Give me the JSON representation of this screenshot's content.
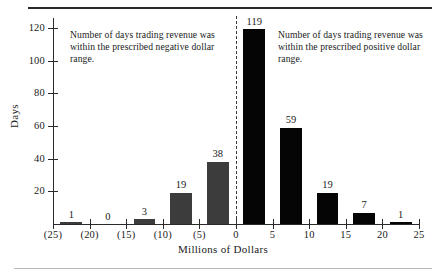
{
  "chart_data": {
    "type": "bar",
    "title": "",
    "xlabel": "Millions of Dollars",
    "ylabel": "Days",
    "xlim": [
      -25,
      25
    ],
    "ylim": [
      0,
      126
    ],
    "grid": false,
    "legend": "none",
    "x_tick_labels": [
      "(25)",
      "(20)",
      "(15)",
      "(10)",
      "(5)",
      "0",
      "5",
      "10",
      "15",
      "20",
      "25"
    ],
    "x_tick_values": [
      -25,
      -20,
      -15,
      -10,
      -5,
      0,
      5,
      10,
      15,
      20,
      25
    ],
    "y_tick_labels": [
      "20",
      "40",
      "60",
      "80",
      "100",
      "120"
    ],
    "y_tick_values": [
      20,
      40,
      60,
      80,
      100,
      120
    ],
    "bin_width": 5,
    "bars": [
      {
        "label": "1",
        "value": 1,
        "bin_start": -24,
        "bin_end": -21,
        "sign": "neg"
      },
      {
        "label": "0",
        "value": 0,
        "bin_start": -19,
        "bin_end": -16,
        "sign": "neg"
      },
      {
        "label": "3",
        "value": 3,
        "bin_start": -14,
        "bin_end": -11,
        "sign": "neg"
      },
      {
        "label": "19",
        "value": 19,
        "bin_start": -9,
        "bin_end": -6,
        "sign": "neg"
      },
      {
        "label": "38",
        "value": 38,
        "bin_start": -4,
        "bin_end": -1,
        "sign": "neg"
      },
      {
        "label": "119",
        "value": 119,
        "bin_start": 1,
        "bin_end": 4,
        "sign": "pos"
      },
      {
        "label": "59",
        "value": 59,
        "bin_start": 6,
        "bin_end": 9,
        "sign": "pos"
      },
      {
        "label": "19",
        "value": 19,
        "bin_start": 11,
        "bin_end": 14,
        "sign": "pos"
      },
      {
        "label": "7",
        "value": 7,
        "bin_start": 16,
        "bin_end": 19,
        "sign": "pos"
      },
      {
        "label": "1",
        "value": 1,
        "bin_start": 21,
        "bin_end": 24,
        "sign": "pos"
      }
    ],
    "annotations": [
      {
        "id": "negative",
        "text": "Number of days trading revenue was within the prescribed negative dollar range."
      },
      {
        "id": "positive",
        "text": "Number of days trading revenue was within the prescribed positive dollar range."
      }
    ],
    "zero_divider": {
      "x": 0,
      "style": "dashed"
    },
    "colors": {
      "negative_bar": "#3c3c3c",
      "positive_bar": "#050505",
      "axis": "#2b2b2b",
      "text": "#1a1a1a",
      "background": "#ffffff"
    }
  }
}
